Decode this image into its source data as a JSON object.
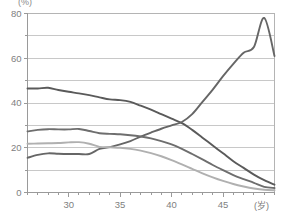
{
  "chart_data": {
    "type": "line",
    "title": "",
    "subtitle": "",
    "ylabel": "(%)",
    "xlabel": "(岁)",
    "xlim": [
      26,
      50
    ],
    "ylim": [
      0,
      80
    ],
    "grid": true,
    "legend": "none",
    "y_ticks": [
      0,
      20,
      40,
      60,
      80
    ],
    "y_minor_ticks": [
      10,
      30,
      50,
      70
    ],
    "x_ticks": [
      30,
      35,
      40,
      45
    ],
    "x_minor_tick_step": 1,
    "x": [
      26,
      27,
      28,
      29,
      30,
      31,
      32,
      33,
      34,
      35,
      36,
      37,
      38,
      39,
      40,
      41,
      42,
      43,
      44,
      45,
      46,
      47,
      48,
      49,
      50
    ],
    "series": [
      {
        "name": "series-1-declining-high",
        "color": "#5a5a5a",
        "values": [
          46.5,
          46.5,
          46.8,
          45.8,
          45.0,
          44.3,
          43.5,
          42.5,
          41.6,
          41.3,
          40.5,
          38.8,
          37.0,
          35.0,
          33.0,
          31.0,
          28.0,
          24.5,
          21.0,
          17.5,
          14.0,
          11.0,
          8.0,
          5.5,
          3.5
        ]
      },
      {
        "name": "series-2-rising-peak",
        "color": "#666666",
        "values": [
          15.5,
          16.8,
          17.5,
          17.3,
          17.2,
          17.2,
          17.2,
          19.5,
          20.3,
          21.5,
          23.0,
          25.0,
          26.8,
          28.5,
          30.0,
          31.5,
          35.0,
          40.5,
          46.0,
          52.0,
          57.5,
          62.5,
          65.0,
          78.0,
          61.0
        ]
      },
      {
        "name": "series-3-mid-plateau",
        "color": "#6e6e6e",
        "values": [
          27.3,
          28.0,
          28.3,
          28.2,
          28.2,
          28.4,
          27.5,
          26.5,
          26.2,
          26.0,
          25.6,
          25.0,
          24.2,
          23.0,
          21.5,
          19.5,
          17.2,
          14.8,
          12.3,
          10.0,
          7.8,
          6.0,
          4.3,
          2.5,
          2.0
        ]
      },
      {
        "name": "series-4-light-declining",
        "color": "#b0b0b0",
        "values": [
          21.8,
          21.9,
          22.0,
          22.1,
          22.4,
          22.5,
          21.8,
          20.4,
          20.2,
          20.0,
          19.5,
          18.7,
          17.6,
          16.2,
          14.5,
          12.6,
          10.6,
          8.6,
          6.8,
          5.2,
          3.8,
          2.7,
          1.8,
          1.2,
          1.0
        ]
      }
    ],
    "colors": {
      "grid": "#c8c8c8",
      "axis": "#9a9a9a",
      "plot_border": "#b4b4b4",
      "tick_label": "#808080",
      "background": "#ffffff"
    }
  }
}
